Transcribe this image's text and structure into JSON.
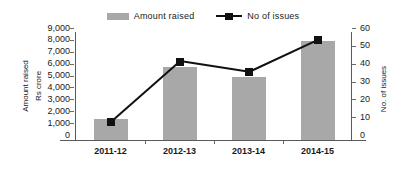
{
  "chart_data": {
    "type": "bar",
    "title": "",
    "subtitle": "",
    "categories": [
      "2011-12",
      "2012-13",
      "2013-14",
      "2014-15"
    ],
    "series": [
      {
        "name": "Amount raised",
        "type": "bar",
        "axis": "left",
        "color": "#a8a8a8",
        "values": [
          1800,
          6100,
          5300,
          8300
        ]
      },
      {
        "name": "No of issues",
        "type": "line",
        "axis": "right",
        "color": "#111111",
        "marker": "square",
        "values": [
          10,
          44,
          38,
          56
        ]
      }
    ],
    "xlabel": "",
    "ylabel": "Amount raised Rs crore",
    "ylabel_line1": "Amount raised",
    "ylabel_line2": "Rs crore",
    "y2label": "No. of issues",
    "ylim": [
      0,
      9000
    ],
    "y2lim": [
      0,
      60
    ],
    "yticks": [
      0,
      1000,
      2000,
      3000,
      4000,
      5000,
      6000,
      7000,
      8000,
      9000
    ],
    "yticklabels": [
      "0",
      "1,000",
      "2,000",
      "3,000",
      "4,000",
      "5,000",
      "6,000",
      "7,000",
      "8,000",
      "9,000"
    ],
    "y2ticks": [
      0,
      10,
      20,
      30,
      40,
      50,
      60
    ],
    "y2ticklabels": [
      "0",
      "10",
      "20",
      "30",
      "40",
      "50",
      "60"
    ],
    "grid": false,
    "legend_position": "top-center",
    "legend": [
      {
        "label": "Amount raised",
        "icon": "bar-swatch",
        "color": "#a8a8a8"
      },
      {
        "label": "No of issues",
        "icon": "line-marker-swatch",
        "color": "#111111"
      }
    ]
  }
}
